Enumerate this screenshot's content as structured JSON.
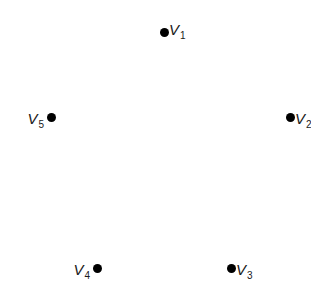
{
  "diagram": {
    "type": "graph-vertices",
    "background": "#ffffff",
    "dot_color": "#000000",
    "vertices": [
      {
        "id": "v1",
        "name": "V",
        "sub": "1",
        "x": 164,
        "y": 32,
        "label_side": "right"
      },
      {
        "id": "v2",
        "name": "V",
        "sub": "2",
        "x": 290,
        "y": 117,
        "label_side": "right"
      },
      {
        "id": "v3",
        "name": "V",
        "sub": "3",
        "x": 231,
        "y": 268,
        "label_side": "right"
      },
      {
        "id": "v4",
        "name": "V",
        "sub": "4",
        "x": 97,
        "y": 268,
        "label_side": "left"
      },
      {
        "id": "v5",
        "name": "V",
        "sub": "5",
        "x": 51,
        "y": 117,
        "label_side": "left"
      }
    ],
    "edges": []
  }
}
